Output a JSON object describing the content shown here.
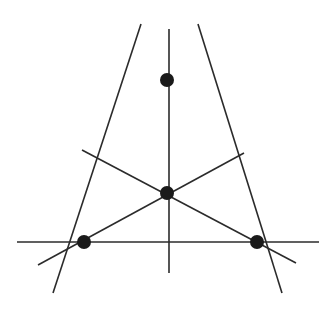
{
  "diagram": {
    "colors": {
      "line": "#2b2b2b",
      "point": "#1a1a1a",
      "background": "#ffffff"
    },
    "points": [
      {
        "id": "top-vertex",
        "x": 167,
        "y": 80,
        "r": 7
      },
      {
        "id": "center-point",
        "x": 167,
        "y": 193,
        "r": 7
      },
      {
        "id": "left-vertex",
        "x": 84,
        "y": 242,
        "r": 7
      },
      {
        "id": "right-vertex",
        "x": 257,
        "y": 242,
        "r": 7
      }
    ],
    "lines": [
      {
        "id": "left-side-extended",
        "x1": 141,
        "y1": 24,
        "x2": 53,
        "y2": 293
      },
      {
        "id": "right-side-extended",
        "x1": 198,
        "y1": 24,
        "x2": 282,
        "y2": 293
      },
      {
        "id": "base-extended",
        "x1": 17,
        "y1": 242,
        "x2": 319,
        "y2": 242
      },
      {
        "id": "vertical-line",
        "x1": 169,
        "y1": 29,
        "x2": 169,
        "y2": 273
      },
      {
        "id": "left-to-upper-right-line",
        "x1": 38,
        "y1": 265,
        "x2": 244,
        "y2": 153
      },
      {
        "id": "right-to-upper-left-line",
        "x1": 296,
        "y1": 263,
        "x2": 82,
        "y2": 150
      }
    ]
  }
}
